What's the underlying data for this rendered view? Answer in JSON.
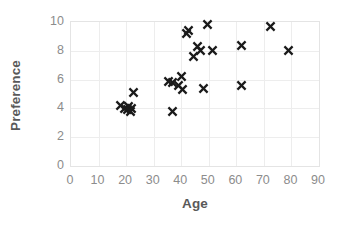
{
  "chart_data": {
    "type": "scatter",
    "title": "",
    "xlabel": "Age",
    "ylabel": "Preference",
    "xlim": [
      0,
      90
    ],
    "ylim": [
      0,
      10
    ],
    "xticks": [
      0,
      10,
      20,
      30,
      40,
      50,
      60,
      70,
      80,
      90
    ],
    "yticks": [
      0,
      2,
      4,
      6,
      8,
      10
    ],
    "xtick_labels": [
      "0",
      "10",
      "20",
      "30",
      "40",
      "50",
      "60",
      "70",
      "80",
      "90"
    ],
    "ytick_labels": [
      "0",
      "2",
      "4",
      "6",
      "8",
      "10"
    ],
    "grid": true,
    "legend": null,
    "marker": "x",
    "marker_color": "#1a1a1a",
    "points": [
      {
        "x": 18.0,
        "y": 4.2
      },
      {
        "x": 19.5,
        "y": 4.0
      },
      {
        "x": 20.5,
        "y": 3.9
      },
      {
        "x": 21.0,
        "y": 4.1
      },
      {
        "x": 21.5,
        "y": 3.8
      },
      {
        "x": 22.0,
        "y": 4.0
      },
      {
        "x": 22.5,
        "y": 5.1
      },
      {
        "x": 35.5,
        "y": 5.9
      },
      {
        "x": 37.0,
        "y": 5.8
      },
      {
        "x": 37.0,
        "y": 3.8
      },
      {
        "x": 39.0,
        "y": 5.6
      },
      {
        "x": 40.0,
        "y": 6.2
      },
      {
        "x": 40.5,
        "y": 5.3
      },
      {
        "x": 42.0,
        "y": 9.2
      },
      {
        "x": 42.5,
        "y": 9.4
      },
      {
        "x": 44.5,
        "y": 7.6
      },
      {
        "x": 46.0,
        "y": 8.3
      },
      {
        "x": 47.0,
        "y": 8.0
      },
      {
        "x": 48.0,
        "y": 5.4
      },
      {
        "x": 49.5,
        "y": 9.8
      },
      {
        "x": 51.5,
        "y": 8.0
      },
      {
        "x": 62.0,
        "y": 5.6
      },
      {
        "x": 62.0,
        "y": 8.4
      },
      {
        "x": 72.5,
        "y": 9.7
      },
      {
        "x": 79.0,
        "y": 8.0
      }
    ]
  }
}
